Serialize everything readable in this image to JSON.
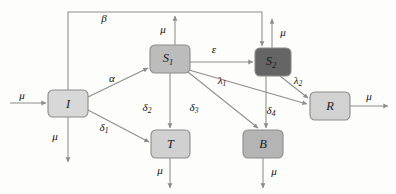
{
  "diagram": {
    "background_color": "#fdfdfb",
    "edge_color": "#8d8d8d",
    "nodes": [
      {
        "id": "I",
        "label": "I",
        "sub": "",
        "x": 48,
        "y": 90,
        "w": 40,
        "h": 27,
        "fill": "#d8d8d8"
      },
      {
        "id": "S1",
        "label": "S",
        "sub": "1",
        "x": 150,
        "y": 45,
        "w": 40,
        "h": 28,
        "fill": "#bcbcbc"
      },
      {
        "id": "S2",
        "label": "S",
        "sub": "2",
        "x": 255,
        "y": 48,
        "w": 36,
        "h": 28,
        "fill": "#656565"
      },
      {
        "id": "T",
        "label": "T",
        "sub": "",
        "x": 151,
        "y": 130,
        "w": 39,
        "h": 28,
        "fill": "#d0d0d0"
      },
      {
        "id": "B",
        "label": "B",
        "sub": "",
        "x": 243,
        "y": 130,
        "w": 40,
        "h": 28,
        "fill": "#b4b4b4"
      },
      {
        "id": "R",
        "label": "R",
        "sub": "",
        "x": 310,
        "y": 92,
        "w": 40,
        "h": 28,
        "fill": "#d2d2d2"
      }
    ],
    "edge_labels": [
      {
        "id": "beta",
        "label": "β",
        "sub": "",
        "x": 104,
        "y": 19
      },
      {
        "id": "mu-in",
        "label": "μ",
        "sub": "",
        "x": 22,
        "y": 96
      },
      {
        "id": "mu-I",
        "label": "μ",
        "sub": "",
        "x": 55,
        "y": 137
      },
      {
        "id": "mu-S1",
        "label": "μ",
        "sub": "",
        "x": 163,
        "y": 30
      },
      {
        "id": "mu-S2",
        "label": "μ",
        "sub": "",
        "x": 283,
        "y": 33
      },
      {
        "id": "mu-T",
        "label": "μ",
        "sub": "",
        "x": 160,
        "y": 171
      },
      {
        "id": "mu-B",
        "label": "μ",
        "sub": "",
        "x": 274,
        "y": 172
      },
      {
        "id": "mu-R",
        "label": "μ",
        "sub": "",
        "x": 369,
        "y": 97
      },
      {
        "id": "alpha",
        "label": "α",
        "sub": "",
        "x": 112,
        "y": 79
      },
      {
        "id": "epsilon",
        "label": "ε",
        "sub": "",
        "x": 214,
        "y": 50
      },
      {
        "id": "delta1",
        "label": "δ",
        "sub": "1",
        "x": 104,
        "y": 128
      },
      {
        "id": "delta2",
        "label": "δ",
        "sub": "2",
        "x": 147,
        "y": 108
      },
      {
        "id": "delta3",
        "label": "δ",
        "sub": "3",
        "x": 194,
        "y": 108
      },
      {
        "id": "delta4",
        "label": "δ",
        "sub": "4",
        "x": 271,
        "y": 111
      },
      {
        "id": "lambda1",
        "label": "λ",
        "sub": "1",
        "x": 222,
        "y": 81
      },
      {
        "id": "lambda2",
        "label": "λ",
        "sub": "2",
        "x": 298,
        "y": 81
      }
    ],
    "edges": [
      {
        "id": "mu-inflow-to-I",
        "from": "mu-source",
        "to": "I",
        "label": "μ"
      },
      {
        "id": "I-to-S1",
        "from": "I",
        "to": "S1",
        "label": "α"
      },
      {
        "id": "I-to-T",
        "from": "I",
        "to": "T",
        "label": "δ1"
      },
      {
        "id": "S1-to-S2",
        "from": "S1",
        "to": "S2",
        "label": "ε"
      },
      {
        "id": "S1-to-T",
        "from": "S1",
        "to": "T",
        "label": "δ2"
      },
      {
        "id": "S1-to-B",
        "from": "S1",
        "to": "B",
        "label": "δ3"
      },
      {
        "id": "S1-to-R",
        "from": "S1",
        "to": "R",
        "label": "λ1"
      },
      {
        "id": "S2-to-B",
        "from": "S2",
        "to": "B",
        "label": "δ4"
      },
      {
        "id": "S2-to-R",
        "from": "S2",
        "to": "R",
        "label": "λ2"
      },
      {
        "id": "S2-to-I-feedback",
        "from": "S2",
        "to": "I",
        "label": "β"
      },
      {
        "id": "I-death",
        "from": "I",
        "to": "out",
        "label": "μ"
      },
      {
        "id": "S1-death",
        "from": "S1",
        "to": "out",
        "label": "μ"
      },
      {
        "id": "S2-death",
        "from": "S2",
        "to": "out",
        "label": "μ"
      },
      {
        "id": "T-death",
        "from": "T",
        "to": "out",
        "label": "μ"
      },
      {
        "id": "B-death",
        "from": "B",
        "to": "out",
        "label": "μ"
      },
      {
        "id": "R-death",
        "from": "R",
        "to": "out",
        "label": "μ"
      }
    ]
  }
}
